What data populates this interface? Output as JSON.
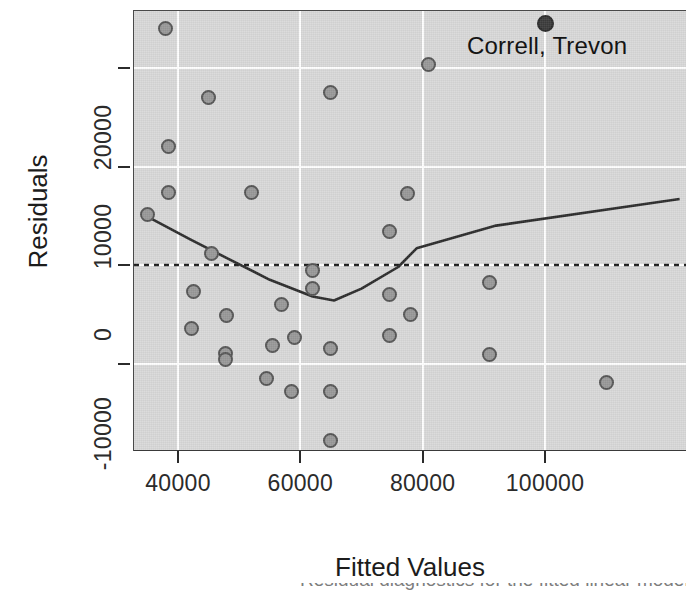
{
  "chart_data": {
    "type": "scatter",
    "title": "",
    "xlabel": "Fitted Values",
    "ylabel": "Residuals",
    "xlim": [
      33000,
      123000
    ],
    "ylim": [
      -22500,
      26500
    ],
    "grid": true,
    "legend": null,
    "panel_background": "#d8d8d8",
    "gridline_color": "#ffffff",
    "point_fill": "#989898",
    "point_stroke": "#555555",
    "highlight_fill": "#3b3b3b",
    "xticks": [
      40000,
      60000,
      80000,
      100000
    ],
    "xtick_labels": [
      "40000",
      "60000",
      "80000",
      "100000"
    ],
    "yticks": [
      20000,
      10000,
      0,
      -10000
    ],
    "ytick_labels": [
      "20000",
      "10000",
      "0",
      "-10000"
    ],
    "points": [
      {
        "x": 38000,
        "y": 24000
      },
      {
        "x": 45000,
        "y": 17000
      },
      {
        "x": 38500,
        "y": 12000
      },
      {
        "x": 38500,
        "y": 7400
      },
      {
        "x": 35000,
        "y": 5100
      },
      {
        "x": 52000,
        "y": 7400
      },
      {
        "x": 45500,
        "y": 1200
      },
      {
        "x": 42500,
        "y": -2700
      },
      {
        "x": 48000,
        "y": -5100
      },
      {
        "x": 42200,
        "y": -6400
      },
      {
        "x": 47800,
        "y": -9000
      },
      {
        "x": 47800,
        "y": -9600
      },
      {
        "x": 54500,
        "y": -11500
      },
      {
        "x": 55500,
        "y": -8200
      },
      {
        "x": 57000,
        "y": -4000
      },
      {
        "x": 59000,
        "y": -7400
      },
      {
        "x": 58500,
        "y": -12800
      },
      {
        "x": 62000,
        "y": -600
      },
      {
        "x": 62000,
        "y": -2400
      },
      {
        "x": 65000,
        "y": 17500
      },
      {
        "x": 65000,
        "y": -8500
      },
      {
        "x": 65000,
        "y": -12800
      },
      {
        "x": 65000,
        "y": -17800
      },
      {
        "x": 74500,
        "y": 3400
      },
      {
        "x": 77500,
        "y": 7300
      },
      {
        "x": 74500,
        "y": -3000
      },
      {
        "x": 78000,
        "y": -5000
      },
      {
        "x": 74500,
        "y": -7200
      },
      {
        "x": 81000,
        "y": 20400
      },
      {
        "x": 91000,
        "y": -1800
      },
      {
        "x": 91000,
        "y": -9100
      },
      {
        "x": 110000,
        "y": -11900
      }
    ],
    "highlight_point": {
      "x": 100000,
      "y": 24500,
      "label": "Correll, Trevon"
    },
    "reference_line": {
      "style": "dotted",
      "y": 0,
      "color": "#1c1c1c"
    },
    "smoother": {
      "style": "solid",
      "color": "#2b2b2b",
      "points": [
        {
          "x": 35000,
          "y": 4900
        },
        {
          "x": 42000,
          "y": 2600
        },
        {
          "x": 48000,
          "y": 700
        },
        {
          "x": 55000,
          "y": -1500
        },
        {
          "x": 62000,
          "y": -3200
        },
        {
          "x": 65500,
          "y": -3600
        },
        {
          "x": 70000,
          "y": -2400
        },
        {
          "x": 76000,
          "y": -200
        },
        {
          "x": 79000,
          "y": 1700
        },
        {
          "x": 92000,
          "y": 4000
        },
        {
          "x": 122000,
          "y": 6700
        }
      ]
    }
  },
  "annotation": {
    "highlight_label": "Correll, Trevon"
  },
  "axis": {
    "x_title": "Fitted Values",
    "y_title": "Residuals"
  },
  "caption": {
    "clipped_text": "Residual diagnostics for the fitted linear model"
  }
}
